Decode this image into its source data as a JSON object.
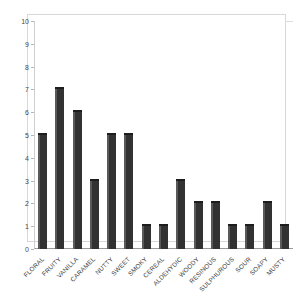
{
  "chart_data": {
    "type": "bar",
    "title": "",
    "subtitle": "",
    "xlabel": "",
    "ylabel": "",
    "ylim": [
      0,
      10
    ],
    "yticks": [
      0,
      1,
      2,
      3,
      4,
      5,
      6,
      7,
      8,
      9,
      10
    ],
    "ytick_labels": [
      "0",
      "1",
      "2",
      "3",
      "4",
      "5",
      "6",
      "7",
      "8",
      "9",
      "10"
    ],
    "grid": false,
    "legend": false,
    "legend_position": "none",
    "bar_color": "#323232",
    "bar_shade_color": "#5a5a5a",
    "bar_top_color": "#1d1d1d",
    "axis_color": "#9a9a9a",
    "background_color": "#ffffff",
    "categories": [
      "FLORAL",
      "FRUITY",
      "VANILLA",
      "CARAMEL",
      "NUTTY",
      "SWEET",
      "SMOKY",
      "CEREAL",
      "ALDEHYDIC",
      "WOODY",
      "RESINOUS",
      "SULPHUROUS",
      "SOUR",
      "SOAPY",
      "MUSTY"
    ],
    "values": [
      5,
      7,
      6,
      3,
      5,
      5,
      1,
      1,
      3,
      2,
      2,
      1,
      1,
      2,
      1
    ]
  }
}
